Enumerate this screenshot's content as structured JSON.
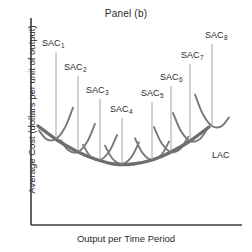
{
  "chart_data": {
    "type": "line",
    "title": "Panel (b)",
    "xlabel": "Output per Time Period",
    "ylabel": "Average Cost (dollars per unit of output)",
    "grid": false,
    "legend": "none",
    "axis_style": "two-axis-L-frame",
    "envelope": {
      "name": "LAC",
      "label": "LAC",
      "description": "Long-run average cost envelope, U-shaped, tangent to all eight short-run average cost curves",
      "label_x": 212,
      "label_y": 150,
      "points": [
        [
          38,
          126
        ],
        [
          57,
          140
        ],
        [
          76,
          151
        ],
        [
          95,
          159
        ],
        [
          114,
          164
        ],
        [
          133,
          164
        ],
        [
          152,
          160
        ],
        [
          171,
          152
        ],
        [
          190,
          141
        ],
        [
          209,
          127
        ]
      ]
    },
    "series": [
      {
        "name": "SAC1",
        "label": "SAC",
        "subscript": "1",
        "label_x": 42,
        "label_y": 38,
        "leader_x": 56,
        "leader_y_top": 52,
        "tangency": [
          56,
          139
        ]
      },
      {
        "name": "SAC2",
        "label": "SAC",
        "subscript": "2",
        "label_x": 64,
        "label_y": 62,
        "leader_x": 78,
        "leader_y_top": 76,
        "tangency": [
          78,
          152
        ]
      },
      {
        "name": "SAC3",
        "label": "SAC",
        "subscript": "3",
        "label_x": 86,
        "label_y": 85,
        "leader_x": 100,
        "leader_y_top": 99,
        "tangency": [
          100,
          160
        ]
      },
      {
        "name": "SAC4",
        "label": "SAC",
        "subscript": "4",
        "label_x": 110,
        "label_y": 104,
        "leader_x": 122,
        "leader_y_top": 118,
        "tangency": [
          122,
          164
        ]
      },
      {
        "name": "SAC5",
        "label": "SAC",
        "subscript": "5",
        "label_x": 141,
        "label_y": 88,
        "leader_x": 152,
        "leader_y_top": 102,
        "tangency": [
          152,
          160
        ]
      },
      {
        "name": "SAC6",
        "label": "SAC",
        "subscript": "6",
        "label_x": 160,
        "label_y": 72,
        "leader_x": 171,
        "leader_y_top": 86,
        "tangency": [
          171,
          152
        ]
      },
      {
        "name": "SAC7",
        "label": "SAC",
        "subscript": "7",
        "label_x": 181,
        "label_y": 50,
        "leader_x": 190,
        "leader_y_top": 64,
        "tangency": [
          190,
          141
        ]
      },
      {
        "name": "SAC8",
        "label": "SAC",
        "subscript": "8",
        "label_x": 205,
        "label_y": 30,
        "leader_x": 212,
        "leader_y_top": 44,
        "tangency": [
          212,
          126
        ]
      }
    ],
    "axes": {
      "y_axis_x": 31,
      "x_axis_y": 225,
      "x_axis_end": 242,
      "y_axis_top": 18
    }
  },
  "colors": {
    "axis": "#3a3a3a",
    "envelope": "#6e6e6e",
    "sac_curve": "#7a7a7a",
    "leader": "#9a9a9a",
    "text": "#2b2b2b",
    "background": "#ffffff"
  }
}
